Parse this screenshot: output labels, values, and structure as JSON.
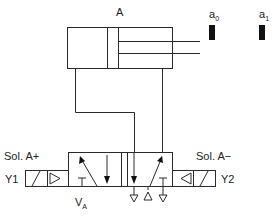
{
  "diagram": {
    "type": "pneumatic circuit",
    "cylinder": {
      "label": "A"
    },
    "sensors": [
      {
        "label": "a",
        "subscript": "0"
      },
      {
        "label": "a",
        "subscript": "1"
      }
    ],
    "valve": {
      "label": "V",
      "subscript": "A",
      "description": "4/2 solenoid valve (double solenoid)"
    },
    "solenoids": [
      {
        "side": "left",
        "name": "Sol. A+",
        "id": "Y1"
      },
      {
        "side": "right",
        "name": "Sol. A−",
        "id": "Y2"
      }
    ],
    "colors": {
      "line": "#2a2a2a",
      "sensor": "#111111",
      "background": "#ffffff"
    }
  }
}
